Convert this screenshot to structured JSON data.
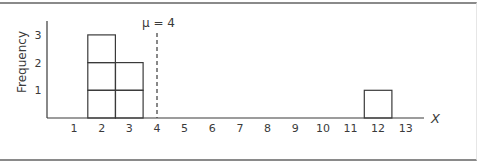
{
  "chart_data": {
    "type": "bar",
    "subtype": "frequency-histogram",
    "title": "",
    "xlabel": "X",
    "ylabel": "Frequency",
    "categories": [
      1,
      2,
      3,
      4,
      5,
      6,
      7,
      8,
      9,
      10,
      11,
      12,
      13
    ],
    "values": [
      0,
      3,
      2,
      0,
      0,
      0,
      0,
      0,
      0,
      0,
      0,
      1,
      0
    ],
    "x_ticks": [
      "1",
      "2",
      "3",
      "4",
      "5",
      "6",
      "7",
      "8",
      "9",
      "10",
      "11",
      "12",
      "13"
    ],
    "y_ticks": [
      "1",
      "2",
      "3"
    ],
    "ylim": [
      0,
      3
    ],
    "xlim": [
      0,
      13.5
    ],
    "grid": false,
    "legend": null,
    "bars_drawn_as_stacked_unit_boxes": true,
    "annotations": [
      {
        "type": "vertical-dashed-line",
        "x": 4,
        "label": "μ = 4"
      }
    ]
  },
  "labels": {
    "ylabel": "Frequency",
    "xlabel": "X",
    "mean": "μ = 4"
  },
  "colors": {
    "line": "#3a3a3a",
    "text": "#3a3a3a",
    "frame": "#8a8a8a",
    "background": "#ffffff"
  }
}
